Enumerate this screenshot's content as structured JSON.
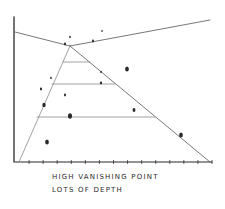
{
  "diagram": {
    "caption": {
      "line1": "HIGH VANISHING POINT",
      "line2": "LOTS OF DEPTH"
    },
    "colors": {
      "ink": "#2a2a2a",
      "light_ink": "#8a8a8a",
      "background": "#ffffff"
    },
    "vanishing_point": {
      "x": 70,
      "y": 46
    },
    "axes": {
      "vertical": {
        "x": 14,
        "y_top": 17,
        "y_bottom": 162
      },
      "baseline": {
        "y": 162,
        "x_start": 15,
        "x_end": 212,
        "tick_count": 14
      }
    },
    "horizon_lines": [
      {
        "x1": 15,
        "y1": 32,
        "x2": 70,
        "y2": 46
      },
      {
        "x1": 70,
        "y1": 46,
        "x2": 210,
        "y2": 20
      }
    ],
    "converging_lines": [
      {
        "x1": 19,
        "y1": 162,
        "x2": 70,
        "y2": 46
      },
      {
        "x1": 70,
        "y1": 46,
        "x2": 210,
        "y2": 162
      }
    ],
    "depth_lines": [
      {
        "y": 62,
        "x1": 63,
        "x2": 90
      },
      {
        "y": 84,
        "x1": 52,
        "x2": 115
      },
      {
        "y": 117,
        "x1": 37,
        "x2": 155
      }
    ],
    "dots": [
      {
        "x": 70,
        "y": 37,
        "r": 1
      },
      {
        "x": 65,
        "y": 44,
        "r": 1.2
      },
      {
        "x": 93,
        "y": 41,
        "r": 1.2
      },
      {
        "x": 102,
        "y": 31,
        "r": 0.9
      },
      {
        "x": 127,
        "y": 69,
        "r": 2.2
      },
      {
        "x": 101,
        "y": 72,
        "r": 1
      },
      {
        "x": 101,
        "y": 83,
        "r": 1.3
      },
      {
        "x": 51,
        "y": 78,
        "r": 1
      },
      {
        "x": 41,
        "y": 89,
        "r": 1.3
      },
      {
        "x": 65,
        "y": 95,
        "r": 1.2
      },
      {
        "x": 44,
        "y": 105,
        "r": 2
      },
      {
        "x": 134,
        "y": 110,
        "r": 1.7
      },
      {
        "x": 70,
        "y": 116,
        "r": 2.4
      },
      {
        "x": 181,
        "y": 135,
        "r": 2.2
      },
      {
        "x": 47,
        "y": 142,
        "r": 2.2
      }
    ]
  }
}
